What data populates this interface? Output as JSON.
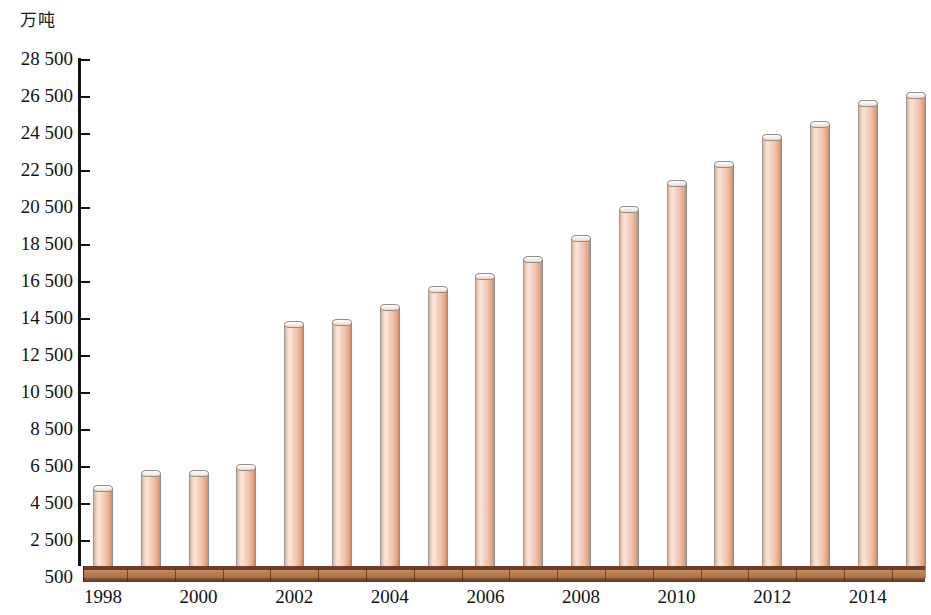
{
  "chart_data": {
    "type": "bar",
    "title": "",
    "subtitle": "",
    "xlabel": "",
    "ylabel": "万吨",
    "unit_label": "万吨",
    "categories": [
      "1998",
      "1999",
      "2000",
      "2001",
      "2002",
      "2003",
      "2004",
      "2005",
      "2006",
      "2007",
      "2008",
      "2009",
      "2010",
      "2011",
      "2012",
      "2013",
      "2014",
      "2015"
    ],
    "values": [
      5300,
      6100,
      6100,
      6450,
      14150,
      14300,
      15100,
      16050,
      16750,
      17700,
      18850,
      20400,
      21800,
      22800,
      24300,
      25000,
      26100,
      26550
    ],
    "ylim": [
      500,
      28500
    ],
    "ytick_step": 2000,
    "ytick_labels": [
      "28 500",
      "26 500",
      "24 500",
      "22 500",
      "20 500",
      "18 500",
      "16 500",
      "14 500",
      "12 500",
      "10 500",
      "8 500",
      "6 500",
      "4 500",
      "2 500",
      "500"
    ],
    "ytick_values": [
      28500,
      26500,
      24500,
      22500,
      20500,
      18500,
      16500,
      14500,
      12500,
      10500,
      8500,
      6500,
      4500,
      2500,
      500
    ],
    "xtick_labels": [
      "1998",
      "2000",
      "2002",
      "2004",
      "2006",
      "2008",
      "2010",
      "2012",
      "2014"
    ],
    "xtick_shown_every": 2,
    "grid": false,
    "legend": null,
    "legend_position": "none",
    "style": "3d-cylinder",
    "colors": {
      "bar_light": "#fbe6dc",
      "bar_mid": "#f2cdb8",
      "bar_dark": "#c98f72",
      "bar_outline": "#8e8e8e",
      "axis": "#121212",
      "floor_top": "#b2764c",
      "floor_front": "#6d3f28",
      "text": "#131313",
      "background": "#ffffff"
    }
  }
}
